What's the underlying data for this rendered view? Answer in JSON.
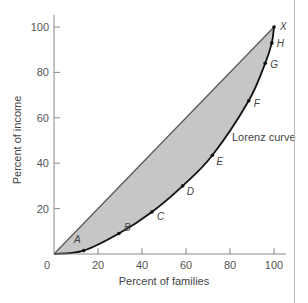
{
  "chart_data": {
    "type": "line",
    "title": "",
    "xlabel": "Percent of families",
    "ylabel": "Percent of income",
    "xlim": [
      0,
      100
    ],
    "ylim": [
      0,
      100
    ],
    "x_ticks": [
      0,
      20,
      40,
      60,
      80,
      100
    ],
    "y_ticks": [
      20,
      40,
      60,
      80,
      100
    ],
    "x_tick_labels": [
      "0",
      "20",
      "40",
      "60",
      "80",
      "100"
    ],
    "y_tick_labels": [
      "20",
      "40",
      "60",
      "80",
      "100"
    ],
    "origin_label": "0",
    "grid": false,
    "series": [
      {
        "name": "Line of equality",
        "x": [
          0,
          100
        ],
        "y": [
          0,
          100
        ],
        "color": "#555555"
      },
      {
        "name": "Lorenz curve",
        "x": [
          0,
          13.5,
          29.5,
          44.5,
          58.5,
          72,
          88.5,
          96,
          99,
          100
        ],
        "y": [
          0,
          1.5,
          9,
          18.5,
          30,
          43.5,
          67.5,
          84,
          93,
          100
        ],
        "color": "#111111"
      }
    ],
    "points": [
      {
        "label": "A",
        "x": 13.5,
        "y": 1.5
      },
      {
        "label": "B",
        "x": 29.5,
        "y": 9
      },
      {
        "label": "C",
        "x": 44.5,
        "y": 18.5
      },
      {
        "label": "D",
        "x": 58.5,
        "y": 30
      },
      {
        "label": "E",
        "x": 72,
        "y": 43.5
      },
      {
        "label": "F",
        "x": 88.5,
        "y": 67.5
      },
      {
        "label": "G",
        "x": 96,
        "y": 84
      },
      {
        "label": "H",
        "x": 99,
        "y": 93
      },
      {
        "label": "X",
        "x": 100,
        "y": 100
      }
    ],
    "shaded_area": "between line of equality and Lorenz curve",
    "annotations": [
      {
        "text": "Lorenz curve",
        "x": 85,
        "y": 50
      }
    ],
    "colors": {
      "fill": "#c6c6c6",
      "axis": "#8a8a8a",
      "curve": "#111111",
      "diagonal": "#555555",
      "text": "#555555"
    }
  }
}
